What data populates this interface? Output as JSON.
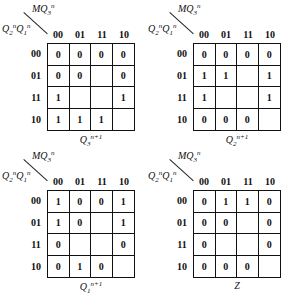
{
  "maps": [
    {
      "row_var_label": "Q2nQ1n",
      "col_var_label": "MQ3n",
      "columns": [
        "00",
        "01",
        "11",
        "10"
      ],
      "rows": [
        "00",
        "01",
        "11",
        "10"
      ],
      "cells": [
        [
          "0",
          "0",
          "0",
          "0"
        ],
        [
          "0",
          "0",
          "",
          "0"
        ],
        [
          "1",
          "",
          "",
          "1"
        ],
        [
          "1",
          "1",
          "1",
          ""
        ]
      ],
      "caption": "Q3n+1"
    },
    {
      "row_var_label": "Q2nQ1n",
      "col_var_label": "MQ3n",
      "columns": [
        "00",
        "01",
        "11",
        "10"
      ],
      "rows": [
        "00",
        "01",
        "11",
        "10"
      ],
      "cells": [
        [
          "0",
          "0",
          "0",
          "0"
        ],
        [
          "1",
          "1",
          "",
          "1"
        ],
        [
          "1",
          "",
          "",
          "1"
        ],
        [
          "0",
          "0",
          "0",
          ""
        ]
      ],
      "caption": "Q2n+1"
    },
    {
      "row_var_label": "Q2nQ1n",
      "col_var_label": "MQ3n",
      "columns": [
        "00",
        "01",
        "11",
        "10"
      ],
      "rows": [
        "00",
        "01",
        "11",
        "10"
      ],
      "cells": [
        [
          "1",
          "0",
          "0",
          "1"
        ],
        [
          "1",
          "0",
          "",
          "1"
        ],
        [
          "0",
          "",
          "",
          "0"
        ],
        [
          "0",
          "1",
          "0",
          ""
        ]
      ],
      "caption": "Q1n+1"
    },
    {
      "row_var_label": "Q2nQ1n",
      "col_var_label": "MQ3n",
      "columns": [
        "00",
        "01",
        "11",
        "10"
      ],
      "rows": [
        "00",
        "01",
        "11",
        "10"
      ],
      "cells": [
        [
          "0",
          "1",
          "1",
          "0"
        ],
        [
          "0",
          "0",
          "",
          "0"
        ],
        [
          "0",
          "",
          "",
          "0"
        ],
        [
          "0",
          "0",
          "0",
          ""
        ]
      ],
      "caption": "Z"
    }
  ]
}
